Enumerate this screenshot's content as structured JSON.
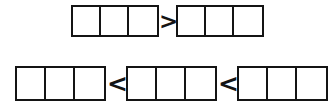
{
  "worksheet": {
    "background_color": "#ffffff",
    "line_color": "#141414",
    "rows": [
      {
        "id": "row-1",
        "elements": [
          {
            "kind": "bar-model",
            "cells": 3,
            "filled": 0,
            "labels": [
              "",
              "",
              ""
            ]
          },
          {
            "kind": "operator",
            "symbol": ">",
            "name": "greater-than"
          },
          {
            "kind": "bar-model",
            "cells": 3,
            "filled": 0,
            "labels": [
              "",
              "",
              ""
            ]
          }
        ]
      },
      {
        "id": "row-2",
        "elements": [
          {
            "kind": "bar-model",
            "cells": 3,
            "filled": 0,
            "labels": [
              "",
              "",
              ""
            ]
          },
          {
            "kind": "operator",
            "symbol": "<",
            "name": "less-than"
          },
          {
            "kind": "bar-model",
            "cells": 3,
            "filled": 0,
            "labels": [
              "",
              "",
              ""
            ]
          },
          {
            "kind": "operator",
            "symbol": "<",
            "name": "less-than"
          },
          {
            "kind": "bar-model",
            "cells": 3,
            "filled": 0,
            "labels": [
              "",
              "",
              ""
            ]
          }
        ]
      }
    ]
  }
}
